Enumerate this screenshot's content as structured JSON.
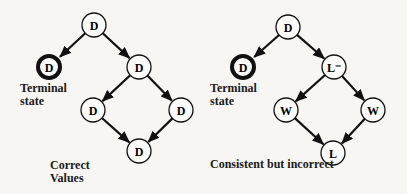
{
  "diagrams": [
    {
      "id": "left",
      "caption": [
        "Correct",
        "Values"
      ],
      "terminal_caption": [
        "Terminal",
        "state"
      ],
      "nodes": [
        {
          "id": "root",
          "label": "D",
          "x": 94,
          "y": 25,
          "terminal": false
        },
        {
          "id": "term",
          "label": "D",
          "x": 49,
          "y": 67,
          "terminal": true
        },
        {
          "id": "mid",
          "label": "D",
          "x": 139,
          "y": 67,
          "terminal": false
        },
        {
          "id": "left",
          "label": "D",
          "x": 93,
          "y": 110,
          "terminal": false
        },
        {
          "id": "right",
          "label": "D",
          "x": 181,
          "y": 110,
          "terminal": false
        },
        {
          "id": "bottom",
          "label": "D",
          "x": 139,
          "y": 151,
          "terminal": false
        }
      ],
      "edges": [
        [
          "root",
          "term"
        ],
        [
          "root",
          "mid"
        ],
        [
          "mid",
          "left"
        ],
        [
          "mid",
          "right"
        ],
        [
          "left",
          "bottom"
        ],
        [
          "right",
          "bottom"
        ]
      ]
    },
    {
      "id": "right",
      "caption": [
        "Consistent but incorrect"
      ],
      "terminal_caption": [
        "Terminal",
        "state"
      ],
      "nodes": [
        {
          "id": "root",
          "label": "D",
          "x": 288,
          "y": 27,
          "terminal": false
        },
        {
          "id": "term",
          "label": "D",
          "x": 243,
          "y": 67,
          "terminal": true
        },
        {
          "id": "mid",
          "label": "L⁻",
          "x": 334,
          "y": 67,
          "terminal": false
        },
        {
          "id": "left",
          "label": "W",
          "x": 286,
          "y": 110,
          "terminal": false
        },
        {
          "id": "right",
          "label": "W",
          "x": 373,
          "y": 110,
          "terminal": false
        },
        {
          "id": "bottom",
          "label": "L",
          "x": 333,
          "y": 153,
          "terminal": false
        }
      ],
      "edges": [
        [
          "root",
          "term"
        ],
        [
          "root",
          "mid"
        ],
        [
          "mid",
          "left"
        ],
        [
          "mid",
          "right"
        ],
        [
          "left",
          "bottom"
        ],
        [
          "right",
          "bottom"
        ]
      ]
    }
  ]
}
